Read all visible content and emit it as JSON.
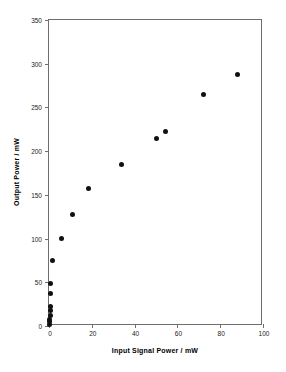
{
  "chart_data": {
    "type": "scatter",
    "title": "",
    "xlabel": "Input Signal Power / mW",
    "ylabel": "Output Power / mW",
    "xlim": [
      0,
      100
    ],
    "ylim": [
      0,
      350
    ],
    "xticks": [
      0,
      20,
      40,
      60,
      80,
      100
    ],
    "yticks": [
      0,
      50,
      100,
      150,
      200,
      250,
      300,
      350
    ],
    "xtick_labels": [
      "0",
      "20",
      "40",
      "60",
      "80",
      "100"
    ],
    "ytick_labels": [
      "0",
      "50",
      "100",
      "150",
      "200",
      "250",
      "300",
      "350"
    ],
    "grid": false,
    "legend": null,
    "marker": {
      "shape": "circle",
      "color": "#111111",
      "size_px": 5
    },
    "series": [
      {
        "name": "Output vs Input Signal Power",
        "points": [
          {
            "x": 0.2,
            "y": 2
          },
          {
            "x": 0.3,
            "y": 5
          },
          {
            "x": 0.4,
            "y": 8
          },
          {
            "x": 0.5,
            "y": 12
          },
          {
            "x": 0.6,
            "y": 18
          },
          {
            "x": 0.7,
            "y": 22
          },
          {
            "x": 0.8,
            "y": 37
          },
          {
            "x": 0.9,
            "y": 49
          },
          {
            "x": 1.5,
            "y": 75
          },
          {
            "x": 6.0,
            "y": 100
          },
          {
            "x": 11.0,
            "y": 127
          },
          {
            "x": 18.6,
            "y": 157
          },
          {
            "x": 34.0,
            "y": 185
          },
          {
            "x": 50.0,
            "y": 214
          },
          {
            "x": 54.5,
            "y": 223
          },
          {
            "x": 72.0,
            "y": 265
          },
          {
            "x": 88.0,
            "y": 288
          }
        ]
      }
    ]
  },
  "style": {
    "axis_color": "#6e6e6e",
    "text_color": "#1a1a1a",
    "background": "#ffffff"
  }
}
